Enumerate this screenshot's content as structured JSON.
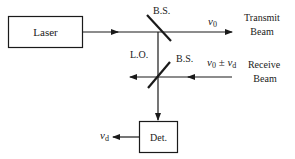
{
  "diagram": {
    "title": "",
    "colors": {
      "ink": "#1a1a1a",
      "background": "#ffffff"
    },
    "nodes": {
      "laser": {
        "label": "Laser"
      },
      "detector": {
        "label": "Det."
      }
    },
    "beam_splitters": [
      {
        "id": "bs-transmit",
        "label": "B.S."
      },
      {
        "id": "bs-receive",
        "label": "B.S."
      }
    ],
    "labels": {
      "lo": "L.O.",
      "transmit_freq": "ν",
      "transmit_freq_sub": "0",
      "transmit_beam_line1": "Transmit",
      "transmit_beam_line2": "Beam",
      "receive_freq_a": "ν",
      "receive_freq_a_sub": "0",
      "receive_freq_op": " ± ",
      "receive_freq_b": "ν",
      "receive_freq_b_sub": "d",
      "receive_beam_line1": "Receive",
      "receive_beam_line2": "Beam",
      "output_freq": "ν",
      "output_freq_sub": "d"
    },
    "edges": [
      {
        "from": "laser",
        "to": "bs-transmit"
      },
      {
        "from": "bs-transmit",
        "to": "transmit-beam",
        "label": "ν0"
      },
      {
        "from": "bs-transmit",
        "to": "bs-receive",
        "label": "L.O."
      },
      {
        "from": "receive-beam",
        "to": "bs-receive",
        "label": "ν0 ± νd"
      },
      {
        "from": "bs-receive",
        "to": "detector"
      },
      {
        "from": "detector",
        "to": "output",
        "label": "νd"
      }
    ]
  }
}
